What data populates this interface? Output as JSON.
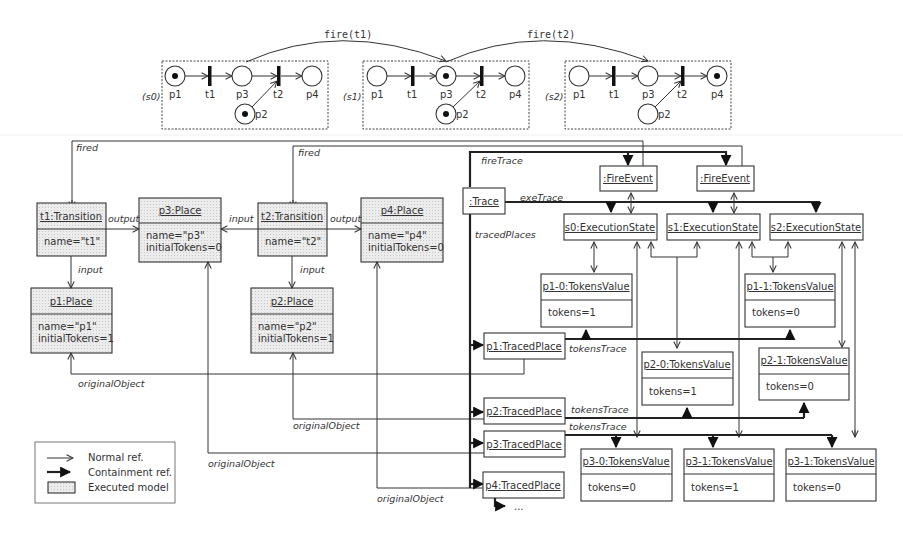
{
  "petri_net": {
    "states": [
      {
        "label": "(s0)",
        "tokens": {
          "p1": true,
          "p2": true,
          "p3": false,
          "p4": false
        }
      },
      {
        "label": "(s1)",
        "tokens": {
          "p1": false,
          "p2": true,
          "p3": true,
          "p4": false
        }
      },
      {
        "label": "(s2)",
        "tokens": {
          "p1": false,
          "p2": false,
          "p3": false,
          "p4": true
        }
      }
    ],
    "place_labels": {
      "p1": "p1",
      "p2": "p2",
      "p3": "p3",
      "p4": "p4"
    },
    "transition_labels": {
      "t1": "t1",
      "t2": "t2"
    },
    "fire_labels": [
      "fire(t1)",
      "fire(t2)"
    ]
  },
  "model": {
    "t1": {
      "title": "t1:Transition",
      "attrs": [
        "name=\"t1\""
      ]
    },
    "t2": {
      "title": "t2:Transition",
      "attrs": [
        "name=\"t2\""
      ]
    },
    "p1": {
      "title": "p1:Place",
      "attrs": [
        "name=\"p1\"",
        "initialTokens=1"
      ]
    },
    "p2": {
      "title": "p2:Place",
      "attrs": [
        "name=\"p2\"",
        "initialTokens=1"
      ]
    },
    "p3": {
      "title": "p3:Place",
      "attrs": [
        "name=\"p3\"",
        "initialTokens=0"
      ]
    },
    "p4": {
      "title": "p4:Place",
      "attrs": [
        "name=\"p4\"",
        "initialTokens=0"
      ]
    }
  },
  "trace": {
    "trace": ":Trace",
    "fire_event": ":FireEvent",
    "states": [
      "s0:ExecutionState",
      "s1:ExecutionState",
      "s2:ExecutionState"
    ],
    "traced_places": [
      "p1:TracedPlace",
      "p2:TracedPlace",
      "p3:TracedPlace",
      "p4:TracedPlace"
    ],
    "values": {
      "p1_0": {
        "title": "p1-0:TokensValue",
        "attr": "tokens=1"
      },
      "p1_1": {
        "title": "p1-1:TokensValue",
        "attr": "tokens=0"
      },
      "p2_0": {
        "title": "p2-0:TokensValue",
        "attr": "tokens=1"
      },
      "p2_1": {
        "title": "p2-1:TokensValue",
        "attr": "tokens=0"
      },
      "p3_0": {
        "title": "p3-0:TokensValue",
        "attr": "tokens=0"
      },
      "p3_1": {
        "title": "p3-1:TokensValue",
        "attr": "tokens=1"
      },
      "p3_2": {
        "title": "p3-1:TokensValue",
        "attr": "tokens=0"
      }
    },
    "ellipsis": "..."
  },
  "edge_labels": {
    "fired": "fired",
    "output": "output",
    "input": "input",
    "fireTrace": "fireTrace",
    "exeTrace": "exeTrace",
    "tracedPlaces": "tracedPlaces",
    "tokensTrace": "tokensTrace",
    "originalObject": "originalObject"
  },
  "legend": {
    "normal": "Normal ref.",
    "containment": "Containment ref.",
    "executed": "Executed model"
  }
}
